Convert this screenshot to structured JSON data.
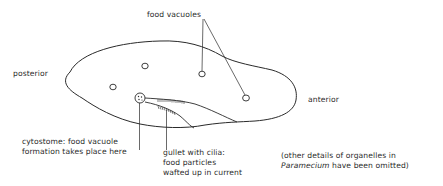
{
  "diagram": {
    "subject": "Paramecium",
    "labels": {
      "food_vacuoles": "food vacuoles",
      "posterior": "posterior",
      "anterior": "anterior",
      "cytostome_line1": "cytostome: food vacuole",
      "cytostome_line2": "formation takes place here",
      "gullet_line1": "gullet with cilia:",
      "gullet_line2": "food particles",
      "gullet_line3": "wafted up in current",
      "note_line1": "(other details of organelles in",
      "note_line2_italic": "Paramecium",
      "note_line2_rest": " have been omitted)"
    },
    "food_vacuoles": [
      {
        "cx": 145,
        "cy": 66
      },
      {
        "cx": 202,
        "cy": 74
      },
      {
        "cx": 246,
        "cy": 98
      },
      {
        "cx": 113,
        "cy": 87
      }
    ],
    "colors": {
      "stroke": "#2a2a2a",
      "text": "#2b2b2b",
      "background": "#ffffff"
    }
  }
}
